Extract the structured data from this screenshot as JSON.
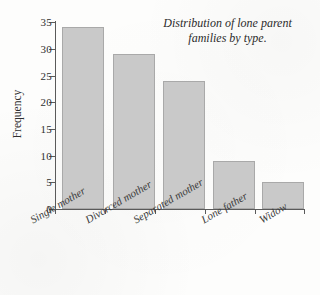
{
  "chart_data": {
    "type": "bar",
    "title": "Distribution of lone parent families by type.",
    "title_line1": "Distribution of lone parent",
    "title_line2": "families by type.",
    "categories": [
      "Single mother",
      "Divorced mother",
      "Separated mother",
      "Lone father",
      "Widow"
    ],
    "values": [
      34,
      29,
      24,
      9,
      5
    ],
    "xlabel": "",
    "ylabel": "Frequency",
    "ylim": [
      0,
      35
    ],
    "ytick_step": 5,
    "yticks": [
      "0",
      "5",
      "10",
      "15",
      "20",
      "25",
      "30",
      "35"
    ],
    "grid": false,
    "legend": false,
    "bar_fill_color": "#c9c9c9",
    "bar_edge_color": "#a9a9a9",
    "axis_color": "#5a5a5a",
    "background_color": "#fdfdfc"
  }
}
